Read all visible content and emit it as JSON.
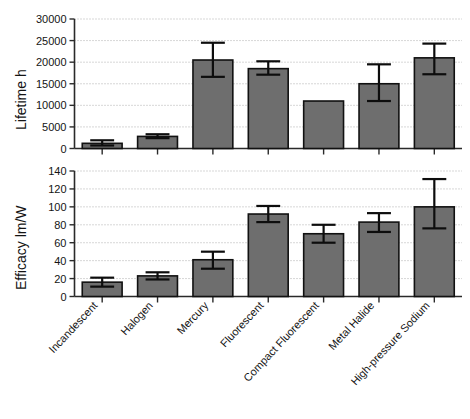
{
  "figure": {
    "background_color": "#ffffff",
    "bar_fill_color": "#6e6e6e",
    "bar_edge_color": "#111111",
    "error_bar_color": "#0d0d0d",
    "gridline_color": "#9a9a9a"
  },
  "chart_data": [
    {
      "type": "bar",
      "panel": "top",
      "title": "",
      "xlabel": "",
      "ylabel": "Lifetime h",
      "ylim": [
        0,
        30000
      ],
      "yticks": [
        0,
        5000,
        10000,
        15000,
        20000,
        25000,
        30000
      ],
      "ytick_labels": [
        "0",
        "5000",
        "10000",
        "15000",
        "20000",
        "25000",
        "30000"
      ],
      "grid": true,
      "legend": "none",
      "categories": [
        "Incandescent",
        "Halogen",
        "Mercury",
        "Fluorescent",
        "Compact Fluorescent",
        "Metal Halide",
        "High-pressure Sodium"
      ],
      "values": [
        1200,
        2800,
        20500,
        18500,
        11000,
        15000,
        21000
      ],
      "error_upper": [
        1900,
        3300,
        24500,
        20200,
        null,
        19500,
        24300
      ],
      "error_lower": [
        700,
        2400,
        16600,
        17100,
        null,
        11000,
        17200
      ]
    },
    {
      "type": "bar",
      "panel": "bottom",
      "title": "",
      "xlabel": "",
      "ylabel": "Efficacy lm/W",
      "ylim": [
        0,
        140
      ],
      "yticks": [
        0,
        20,
        40,
        60,
        80,
        100,
        120,
        140
      ],
      "ytick_labels": [
        "0",
        "20",
        "40",
        "60",
        "80",
        "100",
        "120",
        "140"
      ],
      "grid": true,
      "legend": "none",
      "categories": [
        "Incandescent",
        "Halogen",
        "Mercury",
        "Fluorescent",
        "Compact Fluorescent",
        "Metal Halide",
        "High-pressure Sodium"
      ],
      "values": [
        16,
        23,
        41,
        92,
        70,
        83,
        100
      ],
      "error_upper": [
        21,
        27,
        50,
        101,
        80,
        93,
        131
      ],
      "error_lower": [
        11,
        19,
        31,
        83,
        60,
        72,
        76
      ]
    }
  ],
  "axes": {
    "top_ylabel": "Lifetime h",
    "bottom_ylabel": "Efficacy lm/W",
    "top_ticks": [
      "30000",
      "25000",
      "20000",
      "15000",
      "10000",
      "5000",
      "0"
    ],
    "bottom_ticks": [
      "140",
      "120",
      "100",
      "80",
      "60",
      "40",
      "20",
      "0"
    ],
    "categories": [
      "Incandescent",
      "Halogen",
      "Mercury",
      "Fluorescent",
      "Compact Fluorescent",
      "Metal Halide",
      "High-pressure Sodium"
    ]
  }
}
